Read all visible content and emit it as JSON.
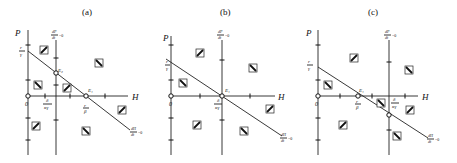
{
  "panels": [
    {
      "id": "a",
      "label": "(a)",
      "y_axis": "P",
      "x_axis": "H",
      "origin": "0",
      "nullcline_p": {
        "num": "dP",
        "den": "dt",
        "eq": "=0"
      },
      "nullcline_h": {
        "num": "dH",
        "den": "dt",
        "eq": "=0"
      },
      "p_intercept": {
        "num": "r",
        "den": "γ"
      },
      "h_intercept": {
        "num": "r",
        "den": "β"
      },
      "vline_label": {
        "num": "δ",
        "den": "κγ"
      },
      "equilibria": [
        "E₁",
        "E₂"
      ]
    },
    {
      "id": "b",
      "label": "(b)",
      "y_axis": "P",
      "x_axis": "H",
      "origin": "0",
      "nullcline_p": {
        "num": "dP",
        "den": "dt",
        "eq": "=0"
      },
      "nullcline_h": {
        "num": "dH",
        "den": "dt",
        "eq": "=0"
      },
      "p_intercept": {
        "num": "r",
        "den": "γ"
      },
      "vline_label": {
        "num": "δ",
        "den": "κγ"
      },
      "equilibria": [
        "E₁"
      ]
    },
    {
      "id": "c",
      "label": "(c)",
      "y_axis": "P",
      "x_axis": "H",
      "origin": "0",
      "nullcline_p": {
        "num": "dP",
        "den": "dt",
        "eq": "=0"
      },
      "nullcline_h": {
        "num": "dH",
        "den": "dt",
        "eq": "=0"
      },
      "p_intercept": {
        "num": "r",
        "den": "γ"
      },
      "h_intercept": {
        "num": "r",
        "den": "β"
      },
      "vline_label": {
        "num": "δ",
        "den": "κγ"
      },
      "equilibria": [
        "E₁"
      ]
    }
  ]
}
